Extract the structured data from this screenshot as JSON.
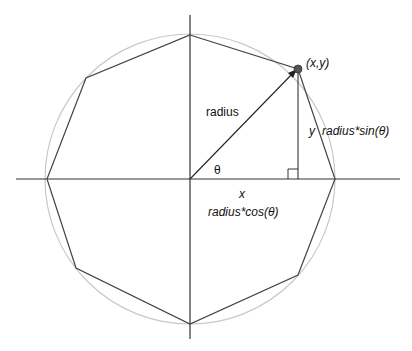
{
  "diagram": {
    "labels": {
      "point": "(x,y)",
      "radius": "radius",
      "theta": "θ",
      "x": "x",
      "y": "y",
      "x_formula": "radius*cos(θ)",
      "y_formula": "radius*sin(θ)"
    },
    "colors": {
      "axis": "#333333",
      "polygon": "#444444",
      "circle": "#c8c8c8",
      "point": "#555555"
    }
  }
}
